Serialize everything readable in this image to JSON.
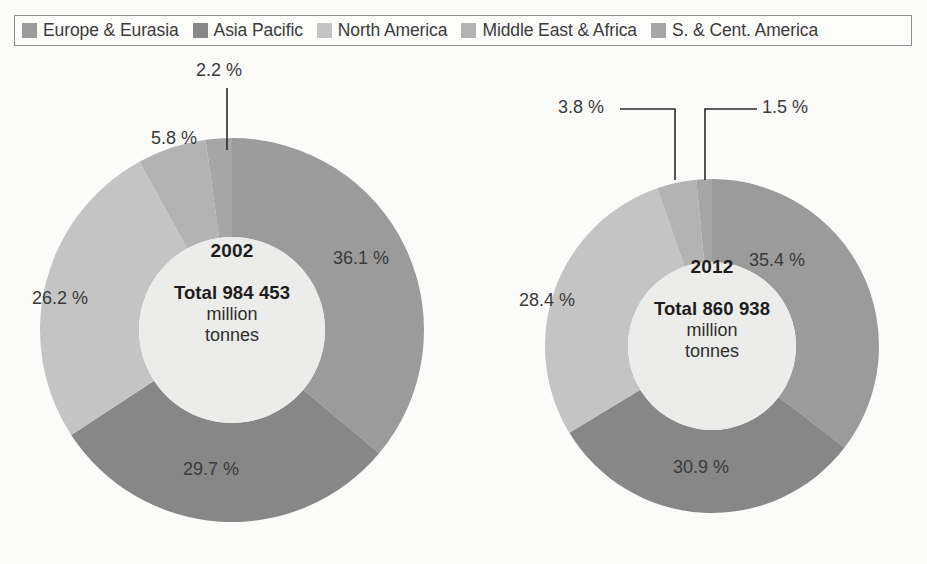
{
  "legend": {
    "items": [
      {
        "label": "Europe & Eurasia",
        "color": "#9b9b9b"
      },
      {
        "label": "Asia Pacific",
        "color": "#878787"
      },
      {
        "label": "North America",
        "color": "#c4c4c4"
      },
      {
        "label": "Middle East & Africa",
        "color": "#b3b3b3"
      },
      {
        "label": "S. & Cent. America",
        "color": "#a6a6a6"
      }
    ]
  },
  "chart_data": [
    {
      "type": "pie",
      "title": "2002",
      "total_label": "Total 984 453",
      "unit_line1": "million",
      "unit_line2": "tonnes",
      "total_value": 984453,
      "unit": "million tonnes",
      "categories": [
        "Europe & Eurasia",
        "Asia Pacific",
        "North America",
        "Middle East & Africa",
        "S. & Cent. America"
      ],
      "values": [
        36.1,
        29.7,
        26.2,
        5.8,
        2.2
      ],
      "value_labels": [
        "36.1 %",
        "29.7 %",
        "26.2 %",
        "5.8 %",
        "2.2 %"
      ],
      "colors": [
        "#9b9b9b",
        "#878787",
        "#c4c4c4",
        "#b3b3b3",
        "#a6a6a6"
      ],
      "hole_color": "#ececea",
      "start_angle_deg": 0,
      "direction": "clockwise",
      "legend_position": "top"
    },
    {
      "type": "pie",
      "title": "2012",
      "total_label": "Total 860 938",
      "unit_line1": "million",
      "unit_line2": "tonnes",
      "total_value": 860938,
      "unit": "million tonnes",
      "categories": [
        "Europe & Eurasia",
        "Asia Pacific",
        "North America",
        "Middle East & Africa",
        "S. & Cent. America"
      ],
      "values": [
        35.4,
        30.9,
        28.4,
        3.8,
        1.5
      ],
      "value_labels": [
        "35.4 %",
        "30.9 %",
        "28.4 %",
        "3.8 %",
        "1.5 %"
      ],
      "colors": [
        "#9b9b9b",
        "#878787",
        "#c4c4c4",
        "#b3b3b3",
        "#a6a6a6"
      ],
      "hole_color": "#ececea",
      "start_angle_deg": 0,
      "direction": "clockwise",
      "legend_position": "top"
    }
  ],
  "pie2002": {
    "year": "2002",
    "total": "Total 984 453",
    "unit1": "million",
    "unit2": "tonnes",
    "p_europe": "36.1 %",
    "p_asia": "29.7 %",
    "p_north": "26.2 %",
    "p_middle": "5.8 %",
    "p_south": "2.2 %"
  },
  "pie2012": {
    "year": "2012",
    "total": "Total 860 938",
    "unit1": "million",
    "unit2": "tonnes",
    "p_europe": "35.4 %",
    "p_asia": "30.9 %",
    "p_north": "28.4 %",
    "p_middle": "3.8 %",
    "p_south": "1.5 %"
  }
}
